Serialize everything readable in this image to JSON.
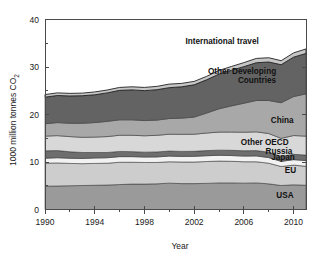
{
  "chart_data": {
    "type": "area",
    "stacked": true,
    "title": "",
    "xlabel": "Year",
    "ylabel": "1000 million tonnes CO2",
    "ylabel_display": "1000 million tonnes CO",
    "ylabel_subscript": "2",
    "xlim": [
      1990,
      2011
    ],
    "ylim": [
      0,
      40
    ],
    "yticks": [
      0,
      10,
      20,
      30,
      40
    ],
    "ytick_labels": [
      "0",
      "10",
      "20",
      "30",
      "40"
    ],
    "xticks": [
      1990,
      1994,
      1998,
      2002,
      2006,
      2010
    ],
    "xtick_labels": [
      "1990",
      "1994",
      "1998",
      "2002",
      "2006",
      "2010"
    ],
    "xticks_minor": [
      1992,
      1996,
      2000,
      2004,
      2008
    ],
    "grid": false,
    "legend_position": "inline-right",
    "x": [
      1990,
      1991,
      1992,
      1993,
      1994,
      1995,
      1996,
      1997,
      1998,
      1999,
      2000,
      2001,
      2002,
      2003,
      2004,
      2005,
      2006,
      2007,
      2008,
      2009,
      2010,
      2011
    ],
    "series": [
      {
        "name": "USA",
        "label": "USA",
        "color": "#9a9a9a",
        "label_x": 2010.0,
        "label_y": 2.4,
        "values": [
          4.9,
          4.95,
          5.0,
          5.05,
          5.1,
          5.15,
          5.25,
          5.35,
          5.35,
          5.4,
          5.55,
          5.45,
          5.45,
          5.5,
          5.6,
          5.6,
          5.55,
          5.6,
          5.4,
          5.05,
          5.2,
          5.1
        ]
      },
      {
        "name": "EU",
        "label": "EU",
        "color": "#cdcdcd",
        "label_x": 2010.2,
        "label_y": 7.6,
        "values": [
          4.85,
          4.85,
          4.7,
          4.6,
          4.6,
          4.6,
          4.7,
          4.6,
          4.55,
          4.5,
          4.5,
          4.55,
          4.55,
          4.6,
          4.6,
          4.55,
          4.5,
          4.45,
          4.35,
          4.0,
          4.15,
          4.0
        ]
      },
      {
        "name": "Japan",
        "label": "Japan",
        "color": "#f2f2f2",
        "label_x": 2010.1,
        "label_y": 10.35,
        "values": [
          1.05,
          1.1,
          1.1,
          1.1,
          1.15,
          1.15,
          1.18,
          1.18,
          1.15,
          1.17,
          1.2,
          1.18,
          1.2,
          1.22,
          1.22,
          1.21,
          1.2,
          1.23,
          1.18,
          1.08,
          1.15,
          1.2
        ]
      },
      {
        "name": "Russia",
        "label": "Russia",
        "color": "#6e6e6e",
        "label_x": 2009.9,
        "label_y": 11.65,
        "values": [
          1.55,
          1.5,
          1.35,
          1.25,
          1.15,
          1.1,
          1.1,
          1.05,
          1.02,
          1.05,
          1.05,
          1.05,
          1.05,
          1.08,
          1.08,
          1.1,
          1.12,
          1.12,
          1.12,
          1.05,
          1.12,
          1.15
        ]
      },
      {
        "name": "Other OECD",
        "label": "Other OECD",
        "color": "#d8d8d8",
        "label_x": 2009.6,
        "label_y": 13.6,
        "values": [
          3.1,
          3.15,
          3.2,
          3.2,
          3.25,
          3.35,
          3.4,
          3.45,
          3.45,
          3.5,
          3.55,
          3.6,
          3.6,
          3.7,
          3.8,
          3.85,
          3.9,
          3.95,
          3.95,
          3.8,
          3.95,
          4.0
        ]
      },
      {
        "name": "China",
        "label": "China",
        "color": "#a8a8a8",
        "label_x": 2010.0,
        "label_y": 18.2,
        "values": [
          2.6,
          2.75,
          2.8,
          2.95,
          3.05,
          3.2,
          3.25,
          3.25,
          3.2,
          3.2,
          3.3,
          3.4,
          3.6,
          4.2,
          4.9,
          5.5,
          6.1,
          6.6,
          6.95,
          7.5,
          8.2,
          8.9
        ]
      },
      {
        "name": "Other Developing Countries",
        "label_line1": "Other Developing",
        "label_line2": "Countries",
        "color": "#636363",
        "label_x": 2008.6,
        "label_y": 28.6,
        "values": [
          5.6,
          5.7,
          5.75,
          5.8,
          5.85,
          6.0,
          6.2,
          6.3,
          6.3,
          6.4,
          6.5,
          6.6,
          6.8,
          7.0,
          7.3,
          7.5,
          7.7,
          7.95,
          8.1,
          8.0,
          8.3,
          8.5
        ]
      },
      {
        "name": "International travel",
        "label": "International travel",
        "color": "#c6c6c6",
        "label_x": 2007.2,
        "label_y": 34.9,
        "values": [
          0.55,
          0.55,
          0.55,
          0.55,
          0.6,
          0.6,
          0.62,
          0.65,
          0.68,
          0.7,
          0.75,
          0.72,
          0.72,
          0.72,
          0.78,
          0.8,
          0.85,
          0.9,
          0.9,
          0.85,
          0.9,
          0.95
        ]
      }
    ]
  }
}
